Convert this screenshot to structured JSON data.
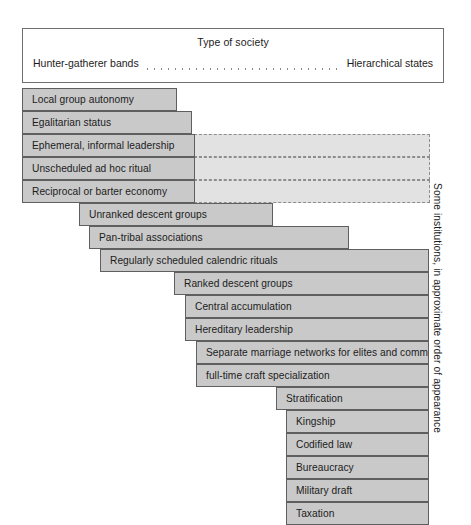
{
  "figure": {
    "header": {
      "title": "Type of society",
      "left_label": "Hunter-gatherer bands",
      "right_label": "Hierarchical states"
    },
    "side_caption": "Some institutions, in approximate order of appearance",
    "colors": {
      "bar_fill": "#c9c9c9",
      "bar_stroke": "#5f5f5f",
      "dash_fill": "#e2e2e2",
      "dash_stroke": "#8d8d8d",
      "box_stroke": "#6f6f6f",
      "text": "#1c1c1c",
      "background": "#ffffff"
    },
    "bars": [
      {
        "label": "Local group autonomy",
        "left": 22,
        "top": 88,
        "width": 155,
        "dashed_to": null
      },
      {
        "label": "Egalitarian status",
        "left": 22,
        "top": 111,
        "width": 170,
        "dashed_to": null
      },
      {
        "label": "Ephemeral, informal leadership",
        "left": 22,
        "top": 134,
        "width": 173,
        "dashed_to": 430
      },
      {
        "label": "Unscheduled ad hoc ritual",
        "left": 22,
        "top": 157,
        "width": 173,
        "dashed_to": 430
      },
      {
        "label": "Reciprocal or barter economy",
        "left": 22,
        "top": 180,
        "width": 173,
        "dashed_to": 430
      },
      {
        "label": "Unranked descent groups",
        "left": 79,
        "top": 203,
        "width": 194,
        "dashed_to": null
      },
      {
        "label": "Pan-tribal associations",
        "left": 89,
        "top": 226,
        "width": 260,
        "dashed_to": null
      },
      {
        "label": "Regularly scheduled calendric rituals",
        "left": 100,
        "top": 249,
        "width": 329,
        "dashed_to": null
      },
      {
        "label": "Ranked descent groups",
        "left": 174,
        "top": 272,
        "width": 255,
        "dashed_to": null
      },
      {
        "label": "Central accumulation",
        "left": 185,
        "top": 295,
        "width": 244,
        "dashed_to": null
      },
      {
        "label": "Hereditary leadership",
        "left": 185,
        "top": 318,
        "width": 244,
        "dashed_to": null
      },
      {
        "label": "Separate marriage networks for elites and commoners",
        "left": 196,
        "top": 341,
        "width": 233,
        "dashed_to": null
      },
      {
        "label": "full-time craft specialization",
        "left": 196,
        "top": 364,
        "width": 233,
        "dashed_to": null
      },
      {
        "label": "Stratification",
        "left": 276,
        "top": 387,
        "width": 153,
        "dashed_to": null
      },
      {
        "label": "Kingship",
        "left": 286,
        "top": 410,
        "width": 143,
        "dashed_to": null
      },
      {
        "label": "Codified law",
        "left": 286,
        "top": 433,
        "width": 143,
        "dashed_to": null
      },
      {
        "label": "Bureaucracy",
        "left": 286,
        "top": 456,
        "width": 143,
        "dashed_to": null
      },
      {
        "label": "Military draft",
        "left": 286,
        "top": 479,
        "width": 143,
        "dashed_to": null
      },
      {
        "label": "Taxation",
        "left": 286,
        "top": 502,
        "width": 143,
        "dashed_to": null
      }
    ]
  }
}
